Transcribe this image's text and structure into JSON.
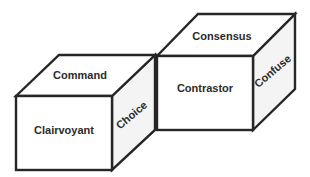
{
  "diagram": {
    "cubes": [
      {
        "id": "left-cube",
        "front_label": "Clairvoyant",
        "top_label": "Command",
        "side_label": "Choice"
      },
      {
        "id": "right-cube",
        "front_label": "Contrastor",
        "top_label": "Consensus",
        "side_label": "Confuse"
      }
    ],
    "colors": {
      "edge": "#262626",
      "side_face": "#f4f4f4",
      "front_face": "#ffffff",
      "text": "#2b2b2b"
    }
  }
}
